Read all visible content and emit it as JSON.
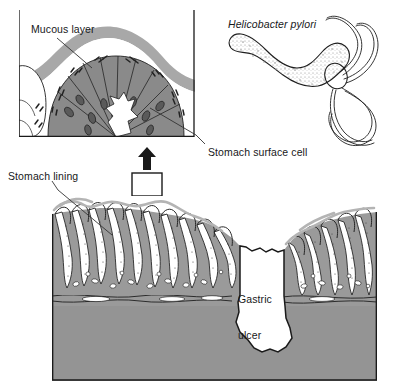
{
  "figure": {
    "title_truncated": "",
    "labels": {
      "mucous_layer": "Mucous layer",
      "helicobacter_pylori": "Helicobacter pylori",
      "stomach_surface_cell": "Stomach surface cell",
      "stomach_lining": "Stomach lining",
      "gastric_ulcer_line1": "Gastric",
      "gastric_ulcer_line2": "ulcer"
    },
    "colors": {
      "background": "#ffffff",
      "outline": "#1a1a1a",
      "mucosa_gray": "#9a9a9a",
      "submucosa_gray": "#8f8f8f",
      "epithelium_gray": "#8a8a8a",
      "mucus_gray": "#a8a8a8",
      "nucleus_gray": "#5f5f5f",
      "bacteria_dark": "#2b2b2b",
      "ulcer_fill": "#ffffff",
      "leader_line": "#333333"
    },
    "panels": {
      "inset": {
        "name": "magnified-villus-tip-inset",
        "x": 19,
        "y": 10,
        "width": 176,
        "height": 127,
        "description": "Magnified cross-section of a gastric pit tip showing the mucous layer, columnar stomach surface cells with nuclei, and Helicobacter pylori bacteria at the cell surface"
      },
      "bacterium": {
        "name": "helicobacter-pylori-illustration",
        "x": 222,
        "y": 30,
        "width": 170,
        "height": 115,
        "description": "Spiral-shaped Helicobacter pylori bacterium with a stippled body and a tuft of multiple long flagella at one pole"
      },
      "main": {
        "name": "stomach-wall-cross-section",
        "x": 52,
        "y": 196,
        "width": 325,
        "height": 185,
        "description": "Cross-section of the stomach wall showing gastric pits and rugae of the lining on the left and right, with a deep irregular gastric ulcer crater in the middle penetrating the mucosa"
      }
    },
    "callouts": {
      "magnification_box": {
        "name": "magnification-region-box",
        "x": 132,
        "y": 173,
        "width": 30,
        "height": 23
      },
      "magnification_arrow": {
        "name": "magnification-arrow-up",
        "x": 142,
        "y": 148,
        "height": 22,
        "direction": "up"
      }
    }
  }
}
